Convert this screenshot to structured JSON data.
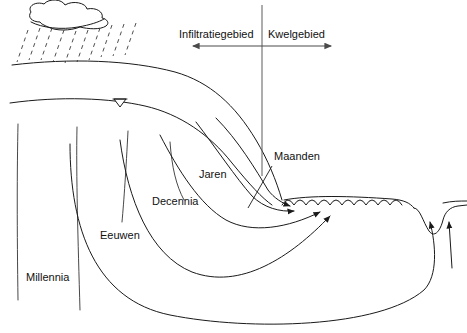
{
  "diagram": {
    "background_color": "#ffffff",
    "line_color": "#1a1a1a",
    "text_color": "#111111",
    "width": 467,
    "height": 333
  },
  "zones": {
    "infiltration_label": "Infiltratiegebied",
    "seepage_label": "Kwelgebied",
    "divider_x": 262,
    "arrow_left_x": 193,
    "arrow_right_x": 331,
    "arrow_y": 46
  },
  "travel_times": [
    {
      "id": "maanden",
      "label": "Maanden",
      "x": 274,
      "y": 160,
      "depth_rank": 1
    },
    {
      "id": "jaren",
      "label": "Jaren",
      "x": 199,
      "y": 178,
      "depth_rank": 2
    },
    {
      "id": "decennia",
      "label": "Decennia",
      "x": 152,
      "y": 205,
      "depth_rank": 3
    },
    {
      "id": "eeuwen",
      "label": "Eeuwen",
      "x": 100,
      "y": 239,
      "depth_rank": 4
    },
    {
      "id": "millennia",
      "label": "Millennia",
      "x": 26,
      "y": 281,
      "depth_rank": 5
    }
  ],
  "features": {
    "cloud_name": "rain-cloud",
    "rain_name": "precipitation-dashes",
    "ground_surface_name": "ground-surface-line",
    "water_table_name": "water-table-line",
    "water_table_symbol": "water-table-triangle",
    "seepage_surface_name": "scalloped-seepage-surface",
    "ditch_name": "drainage-ditch",
    "recharge_lines_name": "vertical-recharge-lines"
  }
}
